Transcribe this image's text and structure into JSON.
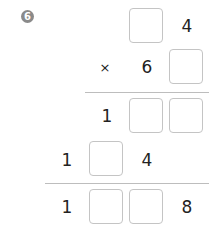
{
  "problem": {
    "number_badge": "6",
    "multiplicand": {
      "tens": "",
      "ones": "4"
    },
    "multiplier": {
      "operator": "×",
      "tens": "6",
      "ones": ""
    },
    "partial_product_1": {
      "hundreds": "1",
      "tens": "",
      "ones": ""
    },
    "partial_product_2": {
      "thousands": "1",
      "hundreds": "",
      "tens": "4"
    },
    "result": {
      "thousands": "1",
      "hundreds": "",
      "tens": "",
      "ones": "8"
    }
  }
}
